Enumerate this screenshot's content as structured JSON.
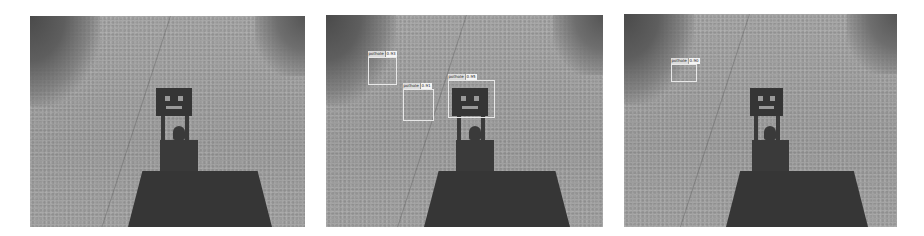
{
  "figure": {
    "panels": [
      {
        "id": "original",
        "detections": []
      },
      {
        "id": "detections-multi",
        "detections": [
          {
            "label": "pothole",
            "score": "0.93"
          },
          {
            "label": "pothole",
            "score": "0.91"
          },
          {
            "label": "pothole",
            "score": "0.95"
          }
        ]
      },
      {
        "id": "detections-single",
        "detections": [
          {
            "label": "pothole",
            "score": "0.90"
          }
        ]
      }
    ],
    "colors": {
      "background": "#ffffff",
      "road": "#9c9c9c",
      "shadow": "#3a3a3a",
      "bbox": "#e8e8e8"
    }
  }
}
